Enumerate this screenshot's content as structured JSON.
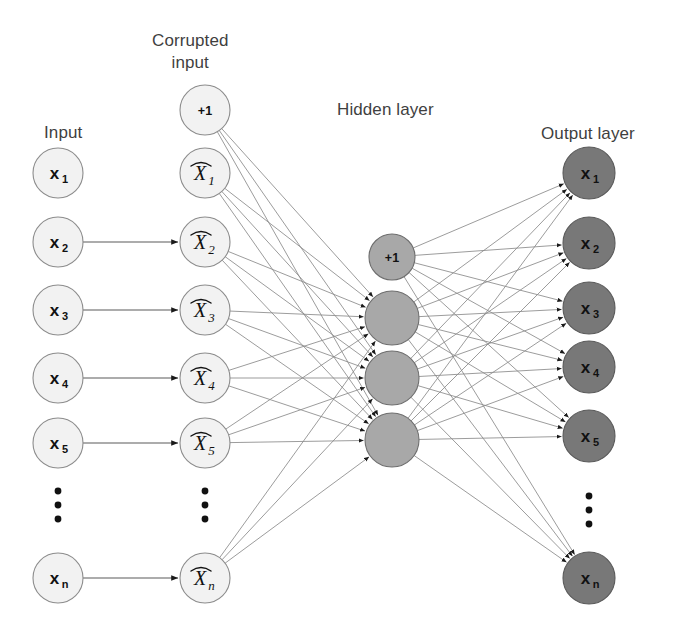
{
  "figure": {
    "type": "neural-network-diagram",
    "title_labels": [
      {
        "id": "input",
        "text": "Input",
        "x": 44,
        "y": 122
      },
      {
        "id": "corrupted-input",
        "text": "Corrupted\ninput",
        "x": 152,
        "y": 30
      },
      {
        "id": "hidden-layer",
        "text": "Hidden layer",
        "x": 337,
        "y": 99
      },
      {
        "id": "output-layer",
        "text": "Output layer",
        "x": 541,
        "y": 123
      }
    ],
    "palette": {
      "input_fill": "#f2f2f2",
      "input_stroke": "#8c8c8c",
      "hidden_fill": "#a8a8a8",
      "hidden_stroke": "#6e6e6e",
      "output_fill": "#787878",
      "output_stroke": "#5a5a5a",
      "edge_color": "#8a8a8a",
      "arrow_color": "#1a1a1a",
      "text_color": "#111111",
      "title_color": "#3f3f3f",
      "background": "#ffffff"
    },
    "layers": [
      {
        "id": "input",
        "name": "Input",
        "cx": 58,
        "r": 25,
        "fill_key": "input_fill",
        "stroke_key": "input_stroke",
        "label_style": "bold",
        "nodes": [
          {
            "id": "in-x1",
            "label": "x",
            "sub": "1",
            "cy": 173
          },
          {
            "id": "in-x2",
            "label": "x",
            "sub": "2",
            "cy": 242
          },
          {
            "id": "in-x3",
            "label": "x",
            "sub": "3",
            "cy": 310
          },
          {
            "id": "in-x4",
            "label": "x",
            "sub": "4",
            "cy": 378
          },
          {
            "id": "in-x5",
            "label": "x",
            "sub": "5",
            "cy": 443
          },
          {
            "id": "in-xn",
            "label": "x",
            "sub": "n",
            "cy": 578
          }
        ],
        "ellipsis": {
          "cx": 58,
          "cy": 505
        }
      },
      {
        "id": "corrupted",
        "name": "Corrupted input",
        "cx": 205,
        "r": 25,
        "fill_key": "input_fill",
        "stroke_key": "input_stroke",
        "label_style": "hat",
        "nodes": [
          {
            "id": "cor-bias",
            "label": "+1",
            "sub": "",
            "cy": 110,
            "bias": true
          },
          {
            "id": "cor-x1",
            "label": "X",
            "sub": "1",
            "cy": 173
          },
          {
            "id": "cor-x2",
            "label": "X",
            "sub": "2",
            "cy": 242
          },
          {
            "id": "cor-x3",
            "label": "X",
            "sub": "3",
            "cy": 310
          },
          {
            "id": "cor-x4",
            "label": "X",
            "sub": "4",
            "cy": 378
          },
          {
            "id": "cor-x5",
            "label": "X",
            "sub": "5",
            "cy": 443
          },
          {
            "id": "cor-xn",
            "label": "X",
            "sub": "n",
            "cy": 578
          }
        ],
        "ellipsis": {
          "cx": 205,
          "cy": 505
        }
      },
      {
        "id": "hidden",
        "name": "Hidden layer",
        "cx": 392,
        "r": 27,
        "fill_key": "hidden_fill",
        "stroke_key": "hidden_stroke",
        "label_style": "bold",
        "nodes": [
          {
            "id": "hid-bias",
            "label": "+1",
            "sub": "",
            "cy": 257,
            "r": 23,
            "bias": true
          },
          {
            "id": "hid-1",
            "label": "",
            "sub": "",
            "cy": 318
          },
          {
            "id": "hid-2",
            "label": "",
            "sub": "",
            "cy": 378
          },
          {
            "id": "hid-3",
            "label": "",
            "sub": "",
            "cy": 440
          }
        ],
        "ellipsis": null
      },
      {
        "id": "output",
        "name": "Output layer",
        "cx": 589,
        "r": 26,
        "fill_key": "output_fill",
        "stroke_key": "output_stroke",
        "label_style": "bold",
        "nodes": [
          {
            "id": "out-x1",
            "label": "x",
            "sub": "1",
            "cy": 173
          },
          {
            "id": "out-x2",
            "label": "x",
            "sub": "2",
            "cy": 243
          },
          {
            "id": "out-x3",
            "label": "x",
            "sub": "3",
            "cy": 308
          },
          {
            "id": "out-x4",
            "label": "x",
            "sub": "4",
            "cy": 367
          },
          {
            "id": "out-x5",
            "label": "x",
            "sub": "5",
            "cy": 436
          },
          {
            "id": "out-xn",
            "label": "x",
            "sub": "n",
            "cy": 578
          }
        ],
        "ellipsis": {
          "cx": 589,
          "cy": 510
        }
      }
    ],
    "corruption_arrows": [
      {
        "from": "in-x2",
        "to": "cor-x2"
      },
      {
        "from": "in-x3",
        "to": "cor-x3"
      },
      {
        "from": "in-x4",
        "to": "cor-x4"
      },
      {
        "from": "in-x5",
        "to": "cor-x5"
      },
      {
        "from": "in-xn",
        "to": "cor-xn"
      }
    ],
    "encode_edges_from": [
      "cor-bias",
      "cor-x1",
      "cor-x2",
      "cor-x3",
      "cor-x4",
      "cor-x5",
      "cor-xn"
    ],
    "encode_edges_to": [
      "hid-1",
      "hid-2",
      "hid-3"
    ],
    "decode_edges_from": [
      "hid-bias",
      "hid-1",
      "hid-2",
      "hid-3"
    ],
    "decode_edges_to": [
      "out-x1",
      "out-x2",
      "out-x3",
      "out-x4",
      "out-x5",
      "out-xn"
    ]
  }
}
